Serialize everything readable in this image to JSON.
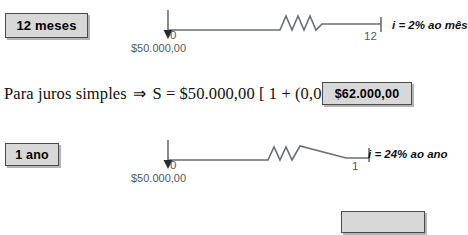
{
  "rows": [
    {
      "tag_label": "12 meses",
      "timeline": {
        "start_label": "0",
        "end_label": "12",
        "principal": "$50.000,00"
      },
      "rate": "i = 2% ao mês"
    },
    {
      "tag_label": "1 ano",
      "timeline": {
        "start_label": "0",
        "end_label": "1",
        "principal": "$50.000,00"
      },
      "rate": "i = 24% ao ano"
    }
  ],
  "formula": {
    "lead": "Para juros simples",
    "arrow": "⇒",
    "expression": "S = $50.000,00 [ 1 + (0,02) (12)] =",
    "result": "$62.000,00"
  },
  "bottom_cut_box": {
    "label": ""
  },
  "colors": {
    "box_fill": "#d8d8d8",
    "box_border": "#4a4a4a",
    "box_shadow": "#b4b4b4",
    "timeline_stroke": "#6b6f72",
    "label_text": "#55595c",
    "body_text": "#101010"
  }
}
